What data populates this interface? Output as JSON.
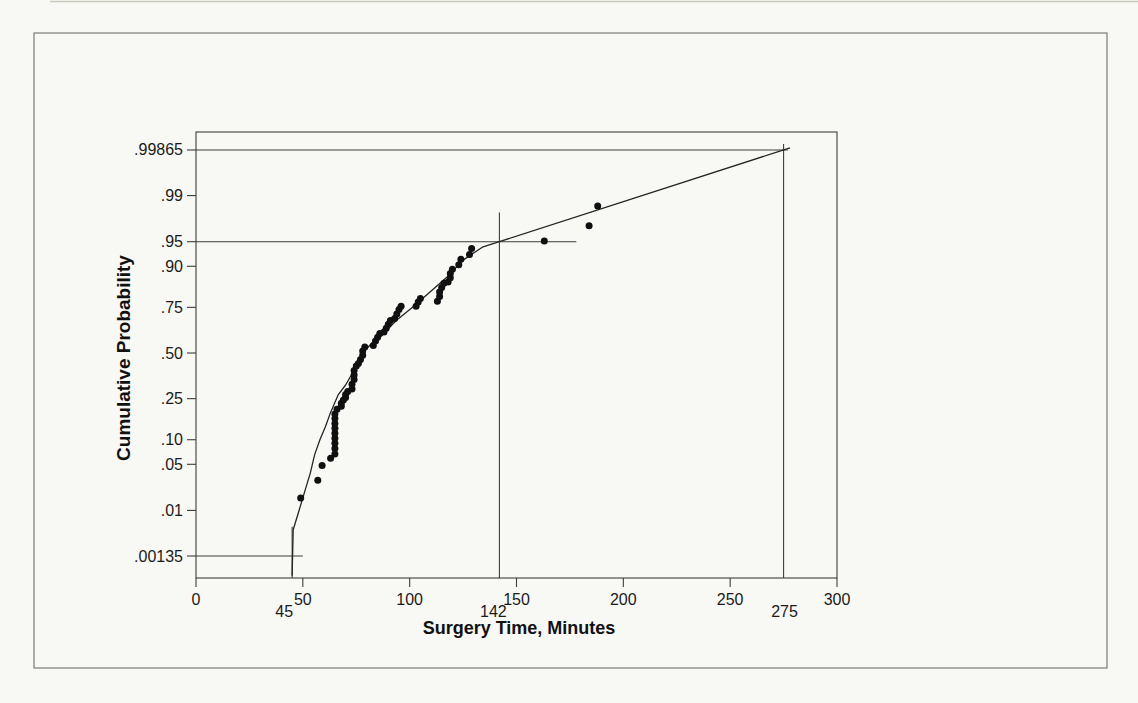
{
  "page": {
    "background": "#f8f8f5",
    "ink": "#1b1b1b",
    "figure_border_color": "#7b7b76"
  },
  "chart_data": {
    "type": "scatter",
    "title": "",
    "xlabel": "Surgery Time, Minutes",
    "ylabel": "Cumulative Probability",
    "legend": "none",
    "grid": "off",
    "x_axis": {
      "min": 0,
      "max": 300,
      "ticks": [
        0,
        50,
        100,
        150,
        200,
        250,
        300
      ]
    },
    "y_axis": {
      "scale": "normal-probability",
      "ticks": [
        ".00135",
        ".01",
        ".05",
        ".10",
        ".25",
        ".50",
        ".75",
        ".90",
        ".95",
        ".99",
        ".99865"
      ]
    },
    "annotations": [
      {
        "label": "45",
        "percentile": ".00135",
        "h": {
          "p": 0.00135,
          "x1": 0,
          "x2": 50
        },
        "v": {
          "x": 45,
          "p_top": 0.0051
        },
        "label_dx": -8
      },
      {
        "label": "142",
        "percentile": ".95",
        "h": {
          "p": 0.95,
          "x1": 0,
          "x2": 178
        },
        "v": {
          "x": 142,
          "p_top": 0.981
        },
        "label_dx": -6
      },
      {
        "label": "275",
        "percentile": ".99865",
        "h": {
          "p": 0.99865,
          "x1": 0,
          "x2": 277
        },
        "v": {
          "x": 275,
          "p_top": 0.999
        },
        "label_dx": 1
      }
    ],
    "points": [
      [
        49,
        0.016
      ],
      [
        57,
        0.03
      ],
      [
        59,
        0.048
      ],
      [
        63,
        0.06
      ],
      [
        65,
        0.068
      ],
      [
        65,
        0.079
      ],
      [
        65,
        0.091
      ],
      [
        65,
        0.104
      ],
      [
        65,
        0.118
      ],
      [
        65,
        0.133
      ],
      [
        65,
        0.149
      ],
      [
        65,
        0.166
      ],
      [
        65,
        0.184
      ],
      [
        66,
        0.203
      ],
      [
        68,
        0.216
      ],
      [
        68,
        0.229
      ],
      [
        69,
        0.243
      ],
      [
        70,
        0.256
      ],
      [
        70,
        0.27
      ],
      [
        71,
        0.284
      ],
      [
        73,
        0.298
      ],
      [
        73,
        0.322
      ],
      [
        74,
        0.347
      ],
      [
        74,
        0.372
      ],
      [
        74,
        0.398
      ],
      [
        75,
        0.423
      ],
      [
        76,
        0.438
      ],
      [
        77,
        0.462
      ],
      [
        78,
        0.487
      ],
      [
        78,
        0.512
      ],
      [
        79,
        0.535
      ],
      [
        83,
        0.545
      ],
      [
        84,
        0.57
      ],
      [
        85,
        0.592
      ],
      [
        86,
        0.614
      ],
      [
        88,
        0.622
      ],
      [
        89,
        0.643
      ],
      [
        90,
        0.664
      ],
      [
        91,
        0.685
      ],
      [
        93,
        0.695
      ],
      [
        94,
        0.718
      ],
      [
        95,
        0.74
      ],
      [
        96,
        0.755
      ],
      [
        103,
        0.755
      ],
      [
        104,
        0.775
      ],
      [
        105,
        0.79
      ],
      [
        113,
        0.778
      ],
      [
        114,
        0.798
      ],
      [
        114,
        0.816
      ],
      [
        115,
        0.833
      ],
      [
        116,
        0.849
      ],
      [
        118,
        0.853
      ],
      [
        119,
        0.867
      ],
      [
        119,
        0.88
      ],
      [
        120,
        0.892
      ],
      [
        123,
        0.904
      ],
      [
        124,
        0.917
      ],
      [
        128,
        0.927
      ],
      [
        129,
        0.939
      ],
      [
        163,
        0.951
      ],
      [
        184,
        0.97
      ],
      [
        188,
        0.985
      ]
    ],
    "fit_curve": [
      [
        45,
        0.0005
      ],
      [
        45.5,
        0.0045
      ],
      [
        48,
        0.0094
      ],
      [
        51,
        0.021
      ],
      [
        53.5,
        0.038
      ],
      [
        55.5,
        0.066
      ],
      [
        58,
        0.1
      ],
      [
        60.5,
        0.137
      ],
      [
        63,
        0.19
      ],
      [
        66.5,
        0.268
      ],
      [
        70,
        0.318
      ],
      [
        74.5,
        0.41
      ],
      [
        78,
        0.5
      ],
      [
        81.5,
        0.547
      ],
      [
        86,
        0.593
      ],
      [
        94,
        0.687
      ],
      [
        101.5,
        0.752
      ],
      [
        109.5,
        0.816
      ],
      [
        117.5,
        0.869
      ],
      [
        125,
        0.915
      ],
      [
        134,
        0.941
      ],
      [
        142,
        0.95
      ],
      [
        278,
        0.99878
      ]
    ]
  }
}
